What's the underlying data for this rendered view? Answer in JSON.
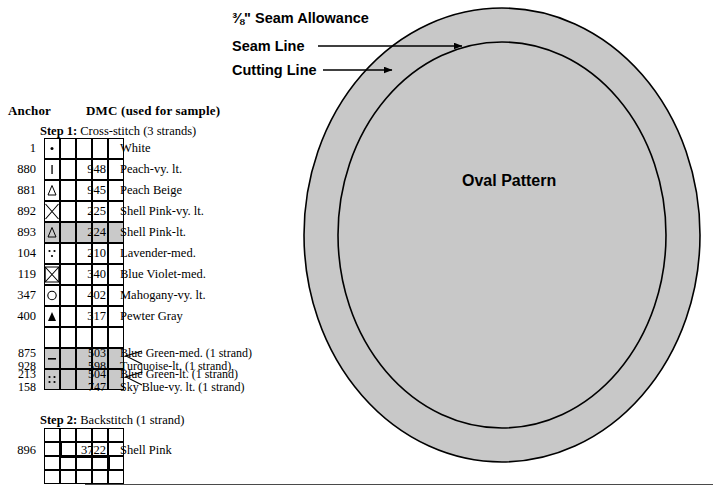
{
  "legend": {
    "header": {
      "anchor": "Anchor",
      "dmc": "DMC (used for sample)"
    },
    "step1": {
      "prefix": "Step 1:",
      "text": "Cross-stitch (3 strands)"
    },
    "step2": {
      "prefix": "Step 2:",
      "text": "Backstitch (1 strand)"
    },
    "cross_stitch_rows": [
      {
        "anchor": "1",
        "symbol": "dot",
        "dmc": "",
        "name": "White",
        "shaded": false
      },
      {
        "anchor": "880",
        "symbol": "bar",
        "dmc": "948",
        "name": "Peach-vy. lt.",
        "shaded": false
      },
      {
        "anchor": "881",
        "symbol": "triangle-open",
        "dmc": "945",
        "name": "Peach Beige",
        "shaded": false
      },
      {
        "anchor": "892",
        "symbol": "cross-large",
        "dmc": "225",
        "name": "Shell Pink-vy. lt.",
        "shaded": false
      },
      {
        "anchor": "893",
        "symbol": "triangle-open",
        "dmc": "224",
        "name": "Shell Pink-lt.",
        "shaded": true
      },
      {
        "anchor": "104",
        "symbol": "three-dots",
        "dmc": "210",
        "name": "Lavender-med.",
        "shaded": false
      },
      {
        "anchor": "119",
        "symbol": "cross-box",
        "dmc": "340",
        "name": "Blue Violet-med.",
        "shaded": false
      },
      {
        "anchor": "347",
        "symbol": "circle",
        "dmc": "402",
        "name": "Mahogany-vy. lt.",
        "shaded": false
      },
      {
        "anchor": "400",
        "symbol": "triangle-solid",
        "dmc": "317",
        "name": "Pewter Gray",
        "shaded": false
      }
    ],
    "blended_groups": [
      {
        "symbol": "dash",
        "shaded": true,
        "lines": [
          {
            "anchor": "875",
            "dmc": "503",
            "name": "Blue Green-med. (1 strand)"
          },
          {
            "anchor": "928",
            "dmc": "598",
            "name": "Turquoise-lt. (1 strand)"
          }
        ]
      },
      {
        "symbol": "four-dots",
        "shaded": true,
        "lines": [
          {
            "anchor": "213",
            "dmc": "504",
            "name": "Blue Green-lt. (1 strand)"
          },
          {
            "anchor": "158",
            "dmc": "747",
            "name": "Sky Blue-vy. lt. (1 strand)"
          }
        ]
      }
    ],
    "backstitch_row": {
      "anchor": "896",
      "dmc": "3722",
      "name": "Shell Pink"
    }
  },
  "diagram": {
    "title": "Oval Pattern",
    "labels": {
      "seam_allowance": "⅜\" Seam Allowance",
      "seam_line": "Seam Line",
      "cutting_line": "Cutting Line"
    },
    "colors": {
      "fill": "#c8c8c8",
      "stroke": "#000000"
    }
  }
}
